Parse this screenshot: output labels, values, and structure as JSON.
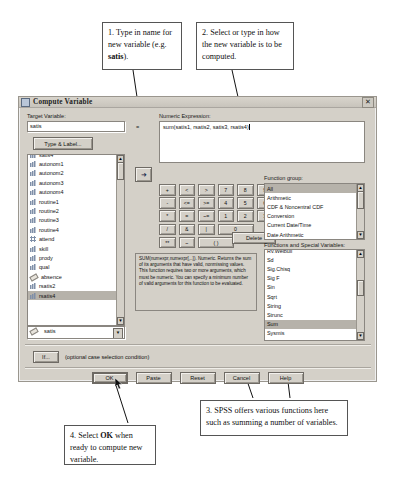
{
  "callouts": [
    {
      "id": "callout-1",
      "pre": "1. Type in name for new variable (e.g. ",
      "bold": "satis",
      "post": ")."
    },
    {
      "id": "callout-2",
      "text": "2. Select or type in how the new variable is to be computed."
    },
    {
      "id": "callout-3",
      "text": "3. SPSS offers various functions here such as summing a number of variables."
    },
    {
      "id": "callout-4",
      "pre": "4. Select ",
      "bold": "OK",
      "post": " when ready to compute new variable."
    }
  ],
  "dialog": {
    "title": "Compute Variable",
    "close_label": "✕",
    "target_variable": {
      "label": "Target Variable:",
      "value": "satis",
      "equals": "=",
      "type_label_button": "Type & Label..."
    },
    "numeric_expression": {
      "label": "Numeric Expression:",
      "value": "sum(satis1, rsatis2, satis3, rsatis4)"
    },
    "move_button": "➜",
    "variables": [
      {
        "name": "satis4",
        "icon": "bar-icon",
        "selected": false
      },
      {
        "name": "autonom1",
        "icon": "bar-icon",
        "selected": false
      },
      {
        "name": "autonom2",
        "icon": "bar-icon",
        "selected": false
      },
      {
        "name": "autonom3",
        "icon": "bar-icon",
        "selected": false
      },
      {
        "name": "autonom4",
        "icon": "bar-icon",
        "selected": false
      },
      {
        "name": "routine1",
        "icon": "bar-icon",
        "selected": false
      },
      {
        "name": "routine2",
        "icon": "bar-icon",
        "selected": false
      },
      {
        "name": "routine3",
        "icon": "bar-icon",
        "selected": false
      },
      {
        "name": "routine4",
        "icon": "bar-icon",
        "selected": false
      },
      {
        "name": "attend",
        "icon": "nominal-icon",
        "selected": false
      },
      {
        "name": "skill",
        "icon": "bar-icon",
        "selected": false
      },
      {
        "name": "prody",
        "icon": "bar-icon",
        "selected": false
      },
      {
        "name": "qual",
        "icon": "bar-icon",
        "selected": false
      },
      {
        "name": "absence",
        "icon": "scale-icon",
        "selected": false
      },
      {
        "name": "rsatis2",
        "icon": "bar-icon",
        "selected": false
      },
      {
        "name": "rsatis4",
        "icon": "bar-icon",
        "selected": true
      },
      {
        "name": "satis",
        "icon": "scale-icon",
        "selected": false
      }
    ],
    "keypad": {
      "rows": [
        [
          "+",
          "<",
          ">",
          "7",
          "8",
          "9"
        ],
        [
          "-",
          "<=",
          ">=",
          "4",
          "5",
          "6"
        ],
        [
          "*",
          "=",
          "~=",
          "1",
          "2",
          "3"
        ],
        [
          "/",
          "&",
          "|",
          "0"
        ],
        [
          "**",
          "~",
          "( )"
        ]
      ],
      "delete_label": "Delete"
    },
    "function_help": "SUM(numexpr,numexpr[,..]). Numeric. Returns the sum of its arguments that have valid, nonmissing values. This function requires two or more arguments, which must be numeric. You can specify a minimum number of valid arguments for this function to be evaluated.",
    "function_group": {
      "label": "Function group:",
      "items": [
        "All",
        "Arithmetic",
        "CDF & Noncentral CDF",
        "Conversion",
        "Current Date/Time",
        "Date Arithmetic"
      ],
      "selected": "All"
    },
    "functions": {
      "label": "Functions and Special Variables:",
      "items": [
        "Rv.Weibull",
        "Sd",
        "Sig.Chisq",
        "Sig F",
        "Sin",
        "Sqrt",
        "String",
        "Strunc",
        "Sum",
        "Sysmis",
        "Time.Days",
        "Time.Hms"
      ],
      "selected": "Sum"
    },
    "if_button": "If...",
    "if_caption": "(optional case selection condition)",
    "buttons": [
      "OK",
      "Paste",
      "Reset",
      "Cancel",
      "Help"
    ]
  }
}
